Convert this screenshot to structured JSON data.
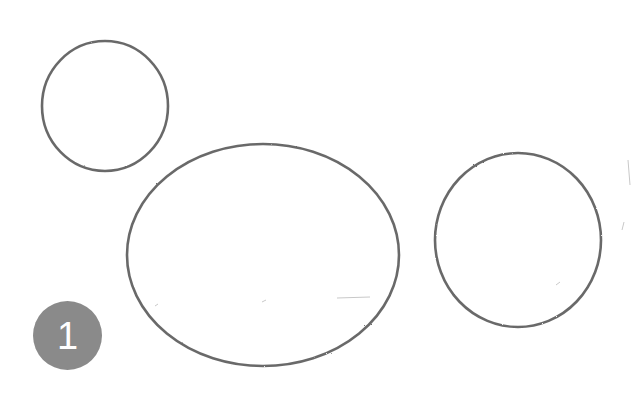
{
  "drawing": {
    "description": "Pencil sketch of three outlined shapes",
    "stroke_color": "#5a5a5a",
    "background": "#ffffff",
    "shapes": [
      {
        "name": "small-circle",
        "cx": 105,
        "cy": 106,
        "rx": 63,
        "ry": 65
      },
      {
        "name": "large-ellipse",
        "cx": 263,
        "cy": 255,
        "rx": 136,
        "ry": 111
      },
      {
        "name": "right-circle",
        "cx": 518,
        "cy": 240,
        "rx": 83,
        "ry": 87
      }
    ]
  },
  "step_badge": {
    "number": "1",
    "color": "#8a8a8a"
  }
}
